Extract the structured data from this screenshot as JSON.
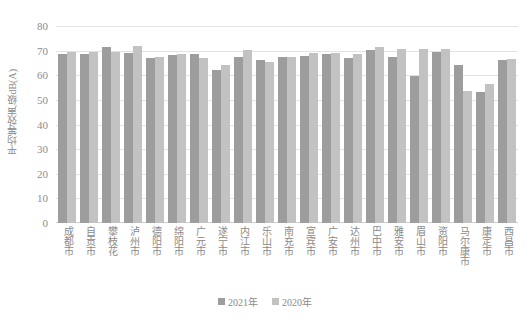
{
  "chart_data": {
    "type": "bar",
    "title": "",
    "subtitle": "",
    "xlabel": "",
    "ylabel": "平均等效声级dB(A)",
    "ylim": [
      0,
      80
    ],
    "yticks": [
      0,
      10,
      20,
      30,
      40,
      50,
      60,
      70,
      80
    ],
    "grid": true,
    "legend_position": "bottom-center",
    "categories": [
      "成都市",
      "自贡市",
      "攀枝花",
      "泸州市",
      "德阳市",
      "绵阳市",
      "广元市",
      "遂宁市",
      "内江市",
      "乐山市",
      "南充市",
      "宣宾市",
      "广安市",
      "达州市",
      "巴中市",
      "雅安市",
      "眉山市",
      "资阳市",
      "马尔康市",
      "康定市",
      "西昌市"
    ],
    "series": [
      {
        "name": "2021年",
        "color": "#9d9d9d",
        "values": [
          68.5,
          68.7,
          71.5,
          68.9,
          67.0,
          68.4,
          68.7,
          62.0,
          67.5,
          66.1,
          67.4,
          67.9,
          68.8,
          67.2,
          70.1,
          67.3,
          59.6,
          69.3,
          64.0,
          53.3,
          66.2
        ]
      },
      {
        "name": "2020年",
        "color": "#c2c2c2",
        "values": [
          69.3,
          69.4,
          69.3,
          71.7,
          67.3,
          68.8,
          67.2,
          64.1,
          70.2,
          65.4,
          67.3,
          69.0,
          69.0,
          68.5,
          71.4,
          70.5,
          70.6,
          70.8,
          53.7,
          56.3,
          66.7
        ]
      }
    ]
  },
  "legend": {
    "items": [
      {
        "label": "2021年"
      },
      {
        "label": "2020年"
      }
    ]
  }
}
